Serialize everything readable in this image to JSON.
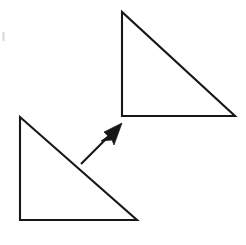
{
  "figure": {
    "type": "geometry-translation-diagram",
    "title": "Translation of a right triangle",
    "background_color": "#ffffff",
    "stroke_color": "#17171a",
    "stroke_width": 2.1,
    "width": 246,
    "height": 245
  },
  "shapes": [
    {
      "name": "preimage-triangle",
      "label": "Lower-left right triangle (preimage)",
      "kind": "right-triangle",
      "fill": "none",
      "stroke": "#17171a",
      "right_angle_at": "bottom-left",
      "points": "20,117 20,220 137,220",
      "vertices": [
        {
          "name": "apex",
          "x": 20,
          "y": 117
        },
        {
          "name": "bottom-left",
          "x": 20,
          "y": 220
        },
        {
          "name": "bottom-right",
          "x": 137,
          "y": 220
        }
      ],
      "leg_vertical_length": 103,
      "leg_horizontal_length": 117
    },
    {
      "name": "image-triangle",
      "label": "Upper-right right triangle (image)",
      "kind": "right-triangle",
      "fill": "none",
      "stroke": "#17171a",
      "right_angle_at": "bottom-left",
      "points": "122,12 122,116 235,116",
      "vertices": [
        {
          "name": "apex",
          "x": 122,
          "y": 12
        },
        {
          "name": "bottom-left",
          "x": 122,
          "y": 116
        },
        {
          "name": "bottom-right",
          "x": 235,
          "y": 116
        }
      ],
      "leg_vertical_length": 104,
      "leg_horizontal_length": 113
    }
  ],
  "arrow": {
    "name": "translation-arrow",
    "label": "Translation direction arrow",
    "fill": "#17171a",
    "stroke": "#17171a",
    "tail": {
      "x": 81,
      "y": 164
    },
    "tip": {
      "x": 122,
      "y": 123
    },
    "shaft_end": {
      "x": 110,
      "y": 135
    },
    "head_points": "122,123 104,132 108,136 101,141 112,140 114,145",
    "direction_degrees": 45,
    "head_filled": true
  },
  "artifacts": [
    {
      "name": "edge-speck",
      "x": 2.5,
      "y": 32,
      "width": 2,
      "height": 9,
      "color": "#d8d8da"
    }
  ]
}
